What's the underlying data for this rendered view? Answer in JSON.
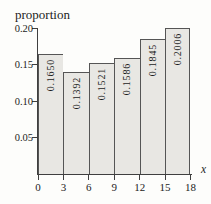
{
  "chart": {
    "y_axis_title": "proportion",
    "x_axis_title": "x"
  },
  "chart_data": {
    "type": "bar",
    "subtype": "histogram",
    "title": "",
    "ylabel": "proportion",
    "xlabel": "x",
    "bin_edges": [
      0,
      3,
      6,
      9,
      12,
      15,
      18
    ],
    "values": [
      0.165,
      0.1392,
      0.1521,
      0.1586,
      0.1845,
      0.2006
    ],
    "bar_labels": [
      "0.1650",
      "0.1392",
      "0.1521",
      "0.1586",
      "0.1845",
      "0.2006"
    ],
    "x_ticks": [
      0,
      3,
      6,
      9,
      12,
      15,
      18
    ],
    "x_tick_labels": [
      "0",
      "3",
      "6",
      "9",
      "12",
      "15",
      "18"
    ],
    "y_ticks": [
      0.05,
      0.1,
      0.15,
      0.2
    ],
    "y_tick_labels": [
      "0.05",
      "0.10",
      "0.15",
      "0.20"
    ],
    "xlim": [
      0,
      18
    ],
    "ylim": [
      0,
      0.2
    ],
    "grid": false,
    "legend": false,
    "colors": {
      "bar_fill": "#e8e7e3",
      "bar_border": "#555555",
      "axis": "#3f3f3f",
      "text": "#1c1c1c",
      "background": "#fdfdfb"
    }
  }
}
